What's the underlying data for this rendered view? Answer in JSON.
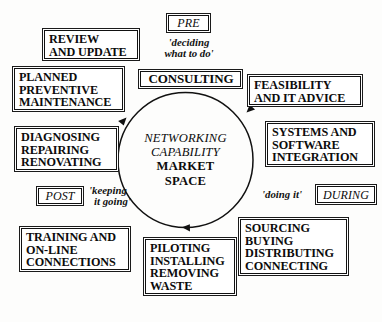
{
  "diagram": {
    "centre": {
      "italic_lines": [
        "NETWORKING",
        "CAPABILITY"
      ],
      "upright_lines": [
        "MARKET",
        "SPACE"
      ]
    },
    "cycle": {
      "direction": "clockwise",
      "stroke_color": "#111111",
      "arrow_count": 3
    },
    "phase_tags": [
      {
        "name": "pre",
        "label": "PRE",
        "caption": [
          "'deciding",
          "what to do'"
        ]
      },
      {
        "name": "during",
        "label": "DURING",
        "caption": [
          "'doing it'"
        ]
      },
      {
        "name": "post",
        "label": "POST",
        "caption": [
          "'keeping",
          "it going'"
        ]
      }
    ],
    "boxes": [
      {
        "name": "review-and-update",
        "lines": [
          "REVIEW",
          "AND UPDATE"
        ]
      },
      {
        "name": "planned-preventive-maintenance",
        "lines": [
          "PLANNED",
          "PREVENTIVE",
          "MAINTENANCE"
        ]
      },
      {
        "name": "diagnosing-repairing-renovating",
        "lines": [
          "DIAGNOSING",
          "REPAIRING",
          "RENOVATING"
        ]
      },
      {
        "name": "training-and-on-line-connections",
        "lines": [
          "TRAINING AND",
          "ON-LINE",
          "CONNECTIONS"
        ]
      },
      {
        "name": "consulting",
        "lines": [
          "CONSULTING"
        ]
      },
      {
        "name": "feasibility-and-it-advice",
        "lines": [
          "FEASIBILITY",
          "AND IT ADVICE"
        ]
      },
      {
        "name": "systems-and-software-integration",
        "lines": [
          "SYSTEMS AND",
          "SOFTWARE",
          "INTEGRATION"
        ]
      },
      {
        "name": "sourcing-buying-distributing-connecting",
        "lines": [
          "SOURCING",
          "BUYING",
          "DISTRIBUTING",
          "CONNECTING"
        ]
      },
      {
        "name": "piloting-installing-removing-waste",
        "lines": [
          "PILOTING",
          "INSTALLING",
          "REMOVING",
          "WASTE"
        ]
      }
    ]
  }
}
